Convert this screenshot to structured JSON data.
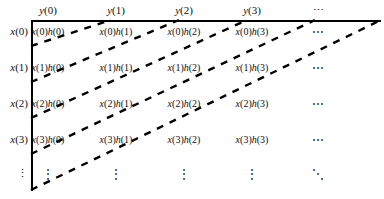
{
  "figure": {
    "kind": "convolution-sum-matrix",
    "row_axis_label": "x",
    "col_axis_label": "y",
    "product_operand": "h",
    "line_color": "#000000",
    "text_color": "#111111",
    "background": "#ffffff"
  },
  "columns": [
    {
      "id": "c0",
      "label": "y(0)",
      "x": 48
    },
    {
      "id": "c1",
      "label": "y(1)",
      "x": 116
    },
    {
      "id": "c2",
      "label": "y(2)",
      "x": 184
    },
    {
      "id": "c3",
      "label": "y(3)",
      "x": 252
    },
    {
      "id": "c4",
      "label": "⋯",
      "x": 318
    }
  ],
  "rows": [
    {
      "id": "r0",
      "label": "x(0)",
      "y": 24
    },
    {
      "id": "r1",
      "label": "x(1)",
      "y": 60
    },
    {
      "id": "r2",
      "label": "x(2)",
      "y": 96
    },
    {
      "id": "r3",
      "label": "x(3)",
      "y": 132
    },
    {
      "id": "r4",
      "label": "⋮",
      "y": 166
    }
  ],
  "cells": [
    {
      "text": "x(0)h(0)",
      "x": 48,
      "y": 25
    },
    {
      "text": "x(0)h(1)",
      "x": 116,
      "y": 25
    },
    {
      "text": "x(0)h(2)",
      "x": 184,
      "y": 25
    },
    {
      "text": "x(0)h(3)",
      "x": 252,
      "y": 25
    },
    {
      "text": "⋯",
      "x": 318,
      "y": 25
    },
    {
      "text": "x(1)h(0)",
      "x": 48,
      "y": 61
    },
    {
      "text": "x(1)h(1)",
      "x": 116,
      "y": 61
    },
    {
      "text": "x(1)h(2)",
      "x": 184,
      "y": 61
    },
    {
      "text": "x(1)h(3)",
      "x": 252,
      "y": 61
    },
    {
      "text": "⋯",
      "x": 318,
      "y": 61
    },
    {
      "text": "x(2)h(0)",
      "x": 48,
      "y": 97
    },
    {
      "text": "x(2)h(1)",
      "x": 116,
      "y": 97
    },
    {
      "text": "x(2)h(2)",
      "x": 184,
      "y": 97
    },
    {
      "text": "x(2)h(3)",
      "x": 252,
      "y": 97
    },
    {
      "text": "⋯",
      "x": 318,
      "y": 97
    },
    {
      "text": "x(3)h(0)",
      "x": 48,
      "y": 133
    },
    {
      "text": "x(3)h(1)",
      "x": 116,
      "y": 133
    },
    {
      "text": "x(3)h(2)",
      "x": 184,
      "y": 133
    },
    {
      "text": "x(3)h(3)",
      "x": 252,
      "y": 133
    },
    {
      "text": "⋯",
      "x": 318,
      "y": 133
    },
    {
      "text": "⋮",
      "x": 48,
      "y": 166
    },
    {
      "text": "⋮",
      "x": 116,
      "y": 166
    },
    {
      "text": "⋮",
      "x": 184,
      "y": 166
    },
    {
      "text": "⋮",
      "x": 252,
      "y": 166
    },
    {
      "text": "⋱",
      "x": 318,
      "y": 166
    }
  ],
  "diagonals": [
    {
      "id": "d0",
      "x1": 31,
      "y1": 46,
      "x2": 111,
      "y2": 20
    },
    {
      "id": "d1",
      "x1": 31,
      "y1": 82,
      "x2": 179,
      "y2": 20
    },
    {
      "id": "d2",
      "x1": 31,
      "y1": 118,
      "x2": 247,
      "y2": 20
    },
    {
      "id": "d3",
      "x1": 31,
      "y1": 154,
      "x2": 315,
      "y2": 20
    },
    {
      "id": "d4",
      "x1": 31,
      "y1": 190,
      "x2": 381,
      "y2": 20
    }
  ],
  "frame": {
    "left": 31,
    "top": 20,
    "width": 350,
    "height": 171,
    "stroke_width": 2.2
  }
}
